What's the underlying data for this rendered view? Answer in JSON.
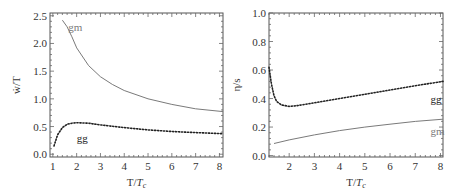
{
  "chart_data": [
    {
      "type": "line",
      "title": "",
      "xlabel": "T/T_c",
      "ylabel": "ẇ/T",
      "xlim": [
        0.88,
        8.15
      ],
      "ylim": [
        -0.05,
        2.55
      ],
      "xticks": [
        1,
        2,
        3,
        4,
        5,
        6,
        7,
        8
      ],
      "yticks": [
        0.0,
        0.5,
        1.0,
        1.5,
        2.0,
        2.5
      ],
      "ytick_labels": [
        "0.0",
        "0.5",
        "1.0",
        "1.5",
        "2.0",
        "2.5"
      ],
      "grid": false,
      "series": [
        {
          "name": "gm",
          "style": "solid",
          "color": "#7a7a7a",
          "x": [
            1.4,
            1.6,
            1.8,
            2.0,
            2.5,
            3.0,
            3.5,
            4.0,
            5.0,
            6.0,
            7.0,
            8.15
          ],
          "y": [
            2.42,
            2.3,
            2.12,
            1.92,
            1.6,
            1.4,
            1.26,
            1.15,
            1.0,
            0.9,
            0.82,
            0.77
          ]
        },
        {
          "name": "gg",
          "style": "dotted",
          "color": "#222222",
          "x": [
            1.05,
            1.2,
            1.4,
            1.6,
            1.8,
            2.0,
            2.5,
            3.0,
            4.0,
            5.0,
            6.0,
            7.0,
            8.15
          ],
          "y": [
            0.15,
            0.35,
            0.48,
            0.54,
            0.56,
            0.57,
            0.56,
            0.53,
            0.48,
            0.44,
            0.41,
            0.39,
            0.37
          ]
        }
      ],
      "annotations": [
        {
          "text": "gm",
          "x": 1.65,
          "y": 2.3
        },
        {
          "text": "gg",
          "x": 2.0,
          "y": 0.3
        }
      ]
    },
    {
      "type": "line",
      "title": "",
      "xlabel": "T/T_c",
      "ylabel": "η/s",
      "xlim": [
        1.2,
        8.1
      ],
      "ylim": [
        -0.01,
        1.0
      ],
      "xticks": [
        2,
        3,
        4,
        5,
        6,
        7,
        8
      ],
      "yticks": [
        0.0,
        0.2,
        0.4,
        0.6,
        0.8,
        1.0
      ],
      "ytick_labels": [
        "0.0",
        "0.2",
        "0.4",
        "0.6",
        "0.8",
        "1.0"
      ],
      "grid": false,
      "series": [
        {
          "name": "gg",
          "style": "dotted",
          "color": "#222222",
          "x": [
            1.2,
            1.3,
            1.4,
            1.5,
            1.7,
            2.0,
            2.3,
            3.0,
            4.0,
            5.0,
            6.0,
            7.0,
            8.1
          ],
          "y": [
            0.62,
            0.5,
            0.42,
            0.38,
            0.355,
            0.345,
            0.35,
            0.37,
            0.4,
            0.43,
            0.46,
            0.49,
            0.52
          ]
        },
        {
          "name": "gm",
          "style": "solid",
          "color": "#7a7a7a",
          "x": [
            1.4,
            2.0,
            3.0,
            4.0,
            5.0,
            6.0,
            7.0,
            8.1
          ],
          "y": [
            0.085,
            0.11,
            0.145,
            0.175,
            0.2,
            0.22,
            0.24,
            0.255
          ]
        }
      ],
      "annotations": [
        {
          "text": "gg",
          "x": 7.6,
          "y": 0.4
        },
        {
          "text": "gm",
          "x": 7.6,
          "y": 0.17
        }
      ]
    }
  ],
  "labels": {
    "left": {
      "ylabel": "ẇ/T",
      "xlabel_main": "T/",
      "xlabel_T": "T",
      "xlabel_sub": "c",
      "gm": "gm",
      "gg": "gg"
    },
    "right": {
      "ylabel": "η/s",
      "xlabel_main": "T/",
      "xlabel_T": "T",
      "xlabel_sub": "c",
      "gm": "gm",
      "gg": "gg"
    }
  }
}
